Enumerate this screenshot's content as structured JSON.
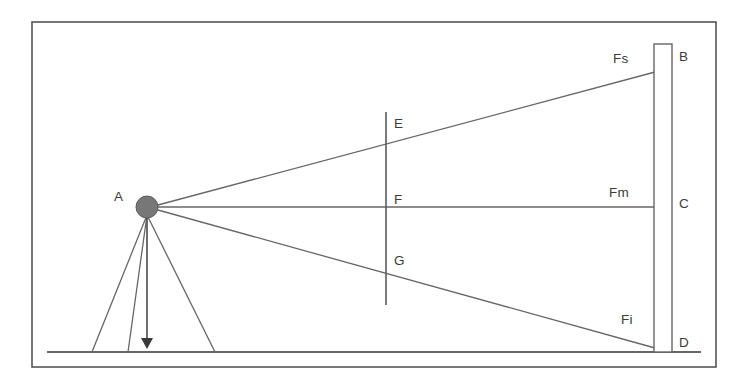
{
  "figure": {
    "kind": "surveying-levelling-diagram",
    "background_color": "#ffffff",
    "line_color": "#666666",
    "frame_color": "#555555",
    "instrument_fill": "#777777",
    "label_color": "#3a3a3a"
  },
  "frame": {
    "name": "outer-border",
    "x": 32,
    "y": 22,
    "width": 684,
    "height": 345
  },
  "ground": {
    "name": "ground-line",
    "x1": 47,
    "y1": 352,
    "x2": 701,
    "y2": 352
  },
  "instrument": {
    "name": "instrument-station",
    "label": "A",
    "center_x": 147,
    "center_y": 207,
    "radius": 11,
    "label_x": 114,
    "label_y": 201
  },
  "tripod": {
    "name": "tripod",
    "legs": [
      {
        "x1": 147,
        "y1": 215,
        "x2": 92,
        "y2": 352
      },
      {
        "x1": 147,
        "y1": 215,
        "x2": 128,
        "y2": 352
      },
      {
        "x1": 147,
        "y1": 215,
        "x2": 215,
        "y2": 352
      }
    ],
    "plumb": {
      "x1": 147,
      "y1": 215,
      "x2": 147,
      "y2": 349
    }
  },
  "staff": {
    "name": "levelling-staff",
    "x": 654,
    "y": 44,
    "width": 18,
    "height": 308,
    "points": [
      {
        "label": "B",
        "x": 679,
        "y": 61,
        "note": "staff-top"
      },
      {
        "label": "C",
        "x": 679,
        "y": 208,
        "note": "staff-middle"
      },
      {
        "label": "D",
        "x": 679,
        "y": 347,
        "note": "staff-foot"
      }
    ]
  },
  "sight_lines": [
    {
      "name": "upper-stadia-line",
      "label": "Fs",
      "x1": 158,
      "y1": 205,
      "x2": 655,
      "y2": 72,
      "label_x": 613,
      "label_y": 63
    },
    {
      "name": "line-of-collimation",
      "label": "Fm",
      "x1": 158,
      "y1": 207,
      "x2": 655,
      "y2": 207,
      "label_x": 609,
      "label_y": 197
    },
    {
      "name": "lower-stadia-line",
      "label": "Fi",
      "x1": 158,
      "y1": 210,
      "x2": 655,
      "y2": 348,
      "label_x": 621,
      "label_y": 324
    }
  ],
  "crosshair": {
    "name": "diaphragm-vertical-line",
    "x": 386,
    "y1": 112,
    "y2": 305,
    "marks": [
      {
        "label": "E",
        "x": 394,
        "y": 128,
        "note": "upper-stadia-hair"
      },
      {
        "label": "F",
        "x": 394,
        "y": 204,
        "note": "central-hair"
      },
      {
        "label": "G",
        "x": 394,
        "y": 265,
        "note": "lower-stadia-hair"
      }
    ]
  },
  "all_labels": [
    "A",
    "B",
    "C",
    "D",
    "E",
    "F",
    "G",
    "Fs",
    "Fm",
    "Fi"
  ]
}
